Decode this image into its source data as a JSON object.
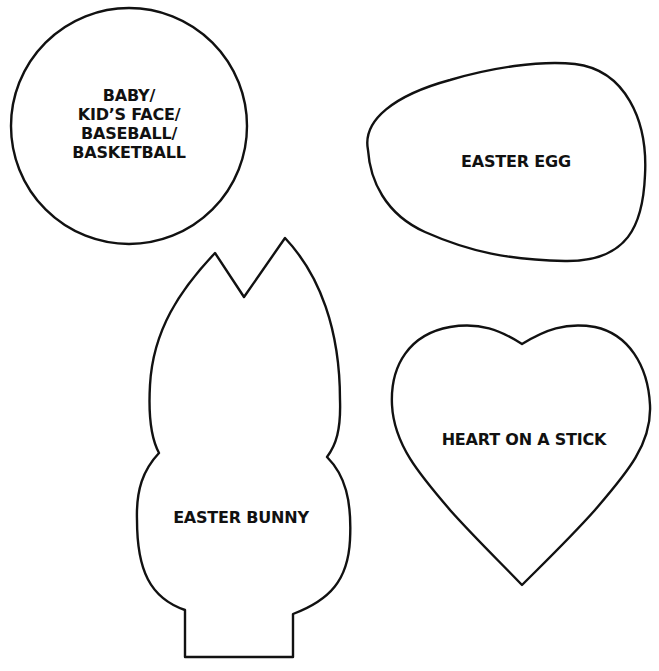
{
  "page": {
    "background": "#ffffff",
    "stroke_color": "#111111"
  },
  "shapes": [
    {
      "id": "circle",
      "shape": "circle",
      "label_lines": [
        "BABY/",
        "KID’S FACE/",
        "BASEBALL/",
        "BASKETBALL"
      ]
    },
    {
      "id": "egg",
      "shape": "egg",
      "label_lines": [
        "EASTER EGG"
      ]
    },
    {
      "id": "bunny",
      "shape": "bunny",
      "label_lines": [
        "EASTER BUNNY"
      ]
    },
    {
      "id": "heart",
      "shape": "heart",
      "label_lines": [
        "HEART ON A STICK"
      ]
    }
  ]
}
